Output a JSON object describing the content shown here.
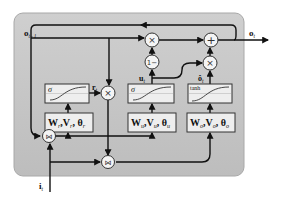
{
  "diagram": {
    "type": "recurrent-gated-cell",
    "colors": {
      "panel_fill": "#c4c4c4",
      "panel_stroke": "#9a9a9a",
      "box_fill": "#eeeeee",
      "box_stroke": "#333333",
      "line": "#111111",
      "op_fill": "#f4f4f4"
    },
    "inputs": {
      "prev_output": {
        "main": "o",
        "sub": "t−1"
      },
      "input": {
        "main": "i",
        "sub": "t"
      }
    },
    "output": {
      "main": "o",
      "sub": "t"
    },
    "gates": [
      {
        "id": "reset",
        "activation": "σ",
        "signal": {
          "main": "r",
          "sub": "t"
        },
        "params": {
          "w": "W",
          "w_sub": "r",
          "v": "V",
          "v_sub": "r",
          "theta": "θ",
          "theta_sub": "r"
        }
      },
      {
        "id": "update",
        "activation": "σ",
        "signal": {
          "main": "u",
          "sub": "t"
        },
        "params": {
          "w": "W",
          "w_sub": "u",
          "v": "V",
          "v_sub": "u",
          "theta": "θ",
          "theta_sub": "u"
        }
      },
      {
        "id": "candidate",
        "activation": "tanh",
        "signal": {
          "main": "ô",
          "sub": "t"
        },
        "params": {
          "w": "W",
          "w_sub": "o",
          "v": "V",
          "v_sub": "o",
          "theta": "θ",
          "theta_sub": "o"
        }
      }
    ],
    "operators": {
      "multiply": "×",
      "add": "+",
      "one_minus": "1−",
      "concat": "⋈"
    }
  }
}
